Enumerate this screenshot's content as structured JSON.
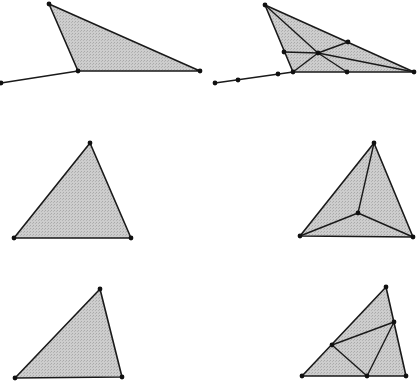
{
  "diagram": {
    "style": {
      "fill": "#c9c9c9",
      "stroke": "#1a1a1a",
      "point": "#111111",
      "background": "#ffffff"
    },
    "panels": [
      {
        "id": "top-left",
        "triangle": [
          [
            49,
            4
          ],
          [
            78,
            71
          ],
          [
            200,
            71
          ]
        ],
        "tail": [
          [
            1,
            83
          ],
          [
            78,
            71
          ]
        ],
        "segments": [],
        "points": [
          [
            49,
            4
          ],
          [
            78,
            71
          ],
          [
            200,
            71
          ],
          [
            1,
            83
          ]
        ]
      },
      {
        "id": "top-right",
        "triangle": [
          [
            265,
            5
          ],
          [
            293,
            72
          ],
          [
            414,
            72
          ]
        ],
        "tail": [
          [
            215,
            83
          ],
          [
            293,
            72
          ]
        ],
        "segments": [
          [
            [
              265,
              5
            ],
            [
              318,
              53
            ]
          ],
          [
            [
              318,
              53
            ],
            [
              414,
              72
            ]
          ],
          [
            [
              284,
              52
            ],
            [
              318,
              53
            ]
          ],
          [
            [
              318,
              53
            ],
            [
              348,
              42
            ]
          ],
          [
            [
              293,
              72
            ],
            [
              318,
              53
            ]
          ],
          [
            [
              318,
              53
            ],
            [
              347,
              72
            ]
          ]
        ],
        "points": [
          [
            265,
            5
          ],
          [
            293,
            72
          ],
          [
            414,
            72
          ],
          [
            284,
            52
          ],
          [
            348,
            42
          ],
          [
            318,
            53
          ],
          [
            347,
            72
          ],
          [
            215,
            83
          ],
          [
            238,
            80
          ],
          [
            278,
            74
          ]
        ]
      },
      {
        "id": "middle-left",
        "triangle": [
          [
            90,
            143
          ],
          [
            14,
            238
          ],
          [
            131,
            238
          ]
        ],
        "tail": null,
        "segments": [],
        "points": [
          [
            90,
            143
          ],
          [
            14,
            238
          ],
          [
            131,
            238
          ]
        ]
      },
      {
        "id": "middle-right",
        "triangle": [
          [
            374,
            143
          ],
          [
            300,
            236
          ],
          [
            413,
            237
          ]
        ],
        "tail": null,
        "segments": [
          [
            [
              374,
              143
            ],
            [
              358,
              213
            ]
          ],
          [
            [
              300,
              236
            ],
            [
              358,
              213
            ]
          ],
          [
            [
              413,
              237
            ],
            [
              358,
              213
            ]
          ]
        ],
        "points": [
          [
            374,
            143
          ],
          [
            300,
            236
          ],
          [
            413,
            237
          ],
          [
            358,
            213
          ]
        ]
      },
      {
        "id": "bottom-left",
        "triangle": [
          [
            100,
            289
          ],
          [
            15,
            378
          ],
          [
            122,
            377
          ]
        ],
        "tail": null,
        "segments": [],
        "points": [
          [
            100,
            289
          ],
          [
            15,
            378
          ],
          [
            122,
            377
          ]
        ]
      },
      {
        "id": "bottom-right",
        "triangle": [
          [
            386,
            287
          ],
          [
            302,
            376
          ],
          [
            406,
            376
          ]
        ],
        "tail": null,
        "segments": [
          [
            [
              332,
              345
            ],
            [
              394,
              322
            ]
          ],
          [
            [
              332,
              345
            ],
            [
              367,
              376
            ]
          ],
          [
            [
              394,
              322
            ],
            [
              367,
              376
            ]
          ]
        ],
        "points": [
          [
            386,
            287
          ],
          [
            302,
            376
          ],
          [
            406,
            376
          ],
          [
            332,
            345
          ],
          [
            394,
            322
          ],
          [
            367,
            376
          ]
        ]
      }
    ]
  }
}
